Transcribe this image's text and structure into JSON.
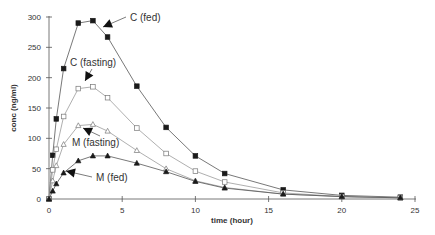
{
  "chart_data": {
    "type": "line",
    "title": "",
    "xlabel": "time (hour)",
    "ylabel": "conc (ng/ml)",
    "xlim": [
      0,
      25
    ],
    "ylim": [
      0,
      300
    ],
    "xticks": [
      0,
      5,
      10,
      15,
      20,
      25
    ],
    "yticks": [
      0,
      50,
      100,
      150,
      200,
      250,
      300
    ],
    "grid": false,
    "legend": "inline annotations with arrows",
    "series": [
      {
        "name": "C (fed)",
        "marker": "filled-square",
        "x": [
          0,
          0.25,
          0.5,
          1,
          2,
          3,
          4,
          6,
          8,
          10,
          12,
          16,
          20,
          24
        ],
        "values": [
          0,
          72,
          132,
          215,
          290,
          294,
          267,
          186,
          118,
          71,
          42,
          15,
          6,
          3
        ]
      },
      {
        "name": "C (fasting)",
        "marker": "open-square",
        "x": [
          0,
          0.25,
          0.5,
          1,
          2,
          3,
          4,
          6,
          8,
          10,
          12,
          16,
          20,
          24
        ],
        "values": [
          0,
          48,
          82,
          136,
          182,
          185,
          167,
          117,
          75,
          46,
          28,
          10,
          4,
          2
        ]
      },
      {
        "name": "M (fasting)",
        "marker": "open-triangle",
        "x": [
          0,
          0.25,
          0.5,
          1,
          2,
          3,
          4,
          6,
          8,
          10,
          12,
          16,
          20,
          24
        ],
        "values": [
          0,
          30,
          55,
          90,
          121,
          123,
          112,
          80,
          50,
          30,
          19,
          8,
          4,
          2
        ]
      },
      {
        "name": "M (fed)",
        "marker": "filled-triangle",
        "x": [
          0,
          0.25,
          0.5,
          1,
          2,
          3,
          4,
          6,
          8,
          10,
          12,
          16,
          20,
          24
        ],
        "values": [
          0,
          13,
          25,
          43,
          63,
          71,
          71,
          59,
          45,
          29,
          18,
          8,
          4,
          2
        ]
      }
    ],
    "annotations": [
      {
        "text": "C (fed)",
        "x_px": 130,
        "y_px": 21,
        "arrow_to": [
          103,
          27
        ]
      },
      {
        "text": "C (fasting)",
        "x_px": 70,
        "y_px": 66,
        "arrow_to": [
          85,
          81
        ]
      },
      {
        "text": "M (fasting)",
        "x_px": 72,
        "y_px": 146,
        "arrow_to": [
          83,
          128
        ]
      },
      {
        "text": "M (fed)",
        "x_px": 96,
        "y_px": 181,
        "arrow_to": [
          66,
          171
        ]
      }
    ]
  }
}
